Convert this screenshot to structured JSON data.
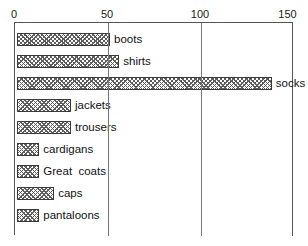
{
  "title_fragment": "j",
  "chart_data": {
    "type": "bar",
    "orientation": "horizontal",
    "title": "",
    "xlabel": "",
    "ylabel": "",
    "xlim": [
      0,
      150
    ],
    "ylim": null,
    "grid": true,
    "legend": false,
    "axis_ticks": [
      "0",
      "50",
      "100",
      "150"
    ],
    "axis_tick_values": [
      0,
      50,
      100,
      150
    ],
    "categories": [
      "boots",
      "shirts",
      "socks",
      "jackets",
      "trousers",
      "cardigans",
      "Great  coats",
      "caps",
      "pantaloons"
    ],
    "values": [
      50,
      55,
      137,
      29,
      29,
      12,
      12,
      20,
      12
    ],
    "bar_labels_inline": true,
    "colors": {
      "bar_fill": "#ffffff",
      "bar_hatch": "#5d5d5d",
      "bar_border": "#3a3a3a",
      "axis": "#555555",
      "gridline": "#777777",
      "text": "#111111",
      "background": "#ffffff"
    }
  }
}
